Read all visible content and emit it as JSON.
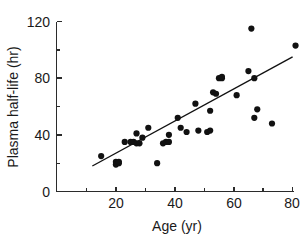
{
  "chart_data": {
    "type": "scatter",
    "title": "",
    "xlabel": "Age (yr)",
    "ylabel": "Plasma half-life (hr)",
    "xlim": [
      0,
      84
    ],
    "ylim": [
      0,
      122
    ],
    "x_ticks": [
      20,
      40,
      60,
      80
    ],
    "x_tick_labels": [
      "20",
      "40",
      "60",
      "80"
    ],
    "x_minor_ticks": [
      10,
      30,
      50,
      70
    ],
    "y_ticks": [
      0,
      40,
      80,
      120
    ],
    "y_tick_labels": [
      "0",
      "40",
      "80",
      "120"
    ],
    "y_minor_ticks": [
      20,
      60,
      100
    ],
    "grid": false,
    "legend": false,
    "marker": "filled-circle",
    "marker_color": "#111111",
    "points": [
      {
        "x": 15,
        "y": 25
      },
      {
        "x": 20,
        "y": 21
      },
      {
        "x": 20,
        "y": 19
      },
      {
        "x": 21,
        "y": 20
      },
      {
        "x": 21,
        "y": 21
      },
      {
        "x": 23,
        "y": 35
      },
      {
        "x": 25,
        "y": 35
      },
      {
        "x": 26,
        "y": 35
      },
      {
        "x": 27,
        "y": 41
      },
      {
        "x": 27,
        "y": 34
      },
      {
        "x": 28,
        "y": 34
      },
      {
        "x": 29,
        "y": 38
      },
      {
        "x": 31,
        "y": 45
      },
      {
        "x": 34,
        "y": 20
      },
      {
        "x": 36,
        "y": 34
      },
      {
        "x": 37,
        "y": 35
      },
      {
        "x": 38,
        "y": 40
      },
      {
        "x": 38,
        "y": 35
      },
      {
        "x": 41,
        "y": 52
      },
      {
        "x": 42,
        "y": 45
      },
      {
        "x": 44,
        "y": 42
      },
      {
        "x": 47,
        "y": 62
      },
      {
        "x": 48,
        "y": 43
      },
      {
        "x": 51,
        "y": 42
      },
      {
        "x": 52,
        "y": 43
      },
      {
        "x": 52,
        "y": 57
      },
      {
        "x": 53,
        "y": 70
      },
      {
        "x": 54,
        "y": 69
      },
      {
        "x": 55,
        "y": 80
      },
      {
        "x": 56,
        "y": 80
      },
      {
        "x": 56,
        "y": 81
      },
      {
        "x": 61,
        "y": 68
      },
      {
        "x": 65,
        "y": 85
      },
      {
        "x": 66,
        "y": 115
      },
      {
        "x": 67,
        "y": 80
      },
      {
        "x": 67,
        "y": 52
      },
      {
        "x": 68,
        "y": 58
      },
      {
        "x": 73,
        "y": 48
      },
      {
        "x": 81,
        "y": 103
      }
    ],
    "fit_line": {
      "type": "linear-regression",
      "x_start": 12,
      "y_start": 18,
      "x_end": 80,
      "y_end": 95
    }
  }
}
